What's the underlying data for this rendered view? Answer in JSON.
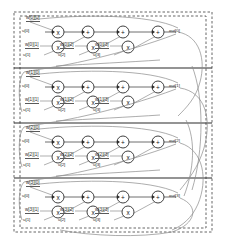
{
  "diagram": {
    "type": "signal-flow-graph",
    "rows": 4,
    "mults_per_row": 4,
    "adds_per_row": 3,
    "node_glyphs": {
      "multiply": "x",
      "add": "+"
    },
    "colors": {
      "wire": "#4a4a4a",
      "feedback_wire": "#8a8a8a",
      "divider": "#2b2b2b",
      "border": "#555555",
      "node_fill": "#ffffff",
      "node_stroke": "#2b2b2b",
      "text": "#2a2a2a",
      "background": "#ffffff"
    },
    "rows_data": [
      {
        "index": 0,
        "weights": [
          "w[0][0]",
          "w[0][1]",
          "w[0][2]",
          "w[0][3]"
        ],
        "inputs": [
          "u[0]",
          "u[1]",
          "u[2]",
          "u[3]"
        ],
        "output": "out[0]"
      },
      {
        "index": 1,
        "weights": [
          "w[1][0]",
          "w[1][1]",
          "w[1][2]",
          "w[1][3]"
        ],
        "inputs": [
          "u[0]",
          "u[1]",
          "u[2]",
          "u[3]"
        ],
        "output": "out[1]"
      },
      {
        "index": 2,
        "weights": [
          "w[2][0]",
          "w[2][1]",
          "w[2][2]",
          "w[2][3]"
        ],
        "inputs": [
          "u[0]",
          "u[1]",
          "u[2]",
          "u[3]"
        ],
        "output": "out[2]"
      },
      {
        "index": 3,
        "weights": [
          "w[3][0]",
          "w[3][1]",
          "w[3][2]",
          "w[3][3]"
        ],
        "inputs": [
          "u[0]",
          "u[1]",
          "u[2]",
          "u[3]"
        ],
        "output": "out[3]"
      }
    ]
  }
}
